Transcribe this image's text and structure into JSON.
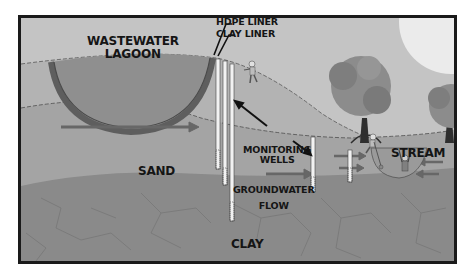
{
  "diagram": {
    "type": "groundwater-monitoring-cross-section",
    "colors": {
      "sky": "#c4c4c4",
      "sun": "#ebebeb",
      "upper_soil": "#b3b3b3",
      "sand": "#a4a4a4",
      "clay": "#8a8a8a",
      "lagoon_water": "#8f8f8f",
      "liner": "#5e5e5e",
      "arrow": "#676767",
      "tree_canopy": "#8c8c8c",
      "tree_trunk": "#2e2e2e",
      "well": "#f2f2f2",
      "frame": "#1a1a1a",
      "text": "#151515"
    },
    "labels": {
      "lagoon_line1": "WASTEWATER",
      "lagoon_line2": "LAGOON",
      "hdpe_liner": "HDPE LINER",
      "clay_liner": "CLAY LINER",
      "sand": "SAND",
      "monitoring_line1": "MONITORING",
      "monitoring_line2": "WELLS",
      "groundwater_line1": "GROUNDWATER",
      "groundwater_line2": "FLOW",
      "stream": "STREAM",
      "clay": "CLAY"
    },
    "elements": [
      "wastewater-lagoon",
      "hdpe-liner",
      "clay-liner",
      "monitoring-wells",
      "groundwater-flow-arrows",
      "sand-layer",
      "clay-layer",
      "stream",
      "trees",
      "sun",
      "people"
    ],
    "monitoring_well_count": 5
  }
}
